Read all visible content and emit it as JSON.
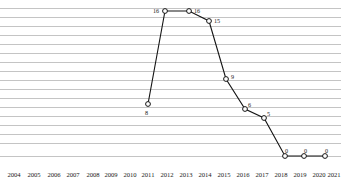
{
  "chart_data": {
    "type": "line",
    "title": "",
    "subtitle": "",
    "xlabel": "",
    "ylabel": "",
    "grid": true,
    "gridline_count": 17,
    "legend": null,
    "legend_position": "none",
    "xlim": [
      2004,
      2021
    ],
    "ylim": [
      0,
      17
    ],
    "marker": "open-circle",
    "line_color": "#141414",
    "marker_fill": "#ffffff",
    "gridline_color": "#c4c4c4",
    "categories": [
      "2004",
      "2005",
      "2006",
      "2007",
      "2008",
      "2009",
      "2010",
      "2011",
      "2012",
      "2013",
      "2014",
      "2015",
      "2016",
      "2017",
      "2018",
      "2019",
      "2020",
      "2021"
    ],
    "values": [
      null,
      null,
      null,
      null,
      null,
      null,
      null,
      null,
      8,
      16,
      16,
      15,
      9,
      6,
      5,
      0,
      0,
      0
    ],
    "point_labels": [
      {
        "x": "2012",
        "value": 8,
        "text": "8",
        "px": 148,
        "py": 104,
        "lx": 145,
        "ly": 110
      },
      {
        "x": "2013",
        "value": 16,
        "text": "16",
        "px": 165,
        "py": 11,
        "lx": 153,
        "ly": 8
      },
      {
        "x": "2014",
        "value": 16,
        "text": "16",
        "px": 189,
        "py": 11,
        "lx": 194,
        "ly": 8
      },
      {
        "x": "2015",
        "value": 15,
        "text": "15",
        "px": 209,
        "py": 21,
        "lx": 214,
        "ly": 18
      },
      {
        "x": "2016",
        "value": 9,
        "text": "9",
        "px": 226,
        "py": 79,
        "lx": 231,
        "ly": 74
      },
      {
        "x": "2017",
        "value": 6,
        "text": "6",
        "px": 245,
        "py": 109,
        "lx": 248,
        "ly": 102
      },
      {
        "x": "2018",
        "value": 5,
        "text": "5",
        "px": 264,
        "py": 118,
        "lx": 267,
        "ly": 111
      },
      {
        "x": "2019",
        "value": 0,
        "text": "0",
        "px": 285,
        "py": 156,
        "lx": 285,
        "ly": 148
      },
      {
        "x": "2020",
        "value": 0,
        "text": "0",
        "px": 304,
        "py": 156,
        "lx": 304,
        "ly": 148
      },
      {
        "x": "2021",
        "value": 0,
        "text": "0",
        "px": 325,
        "py": 156,
        "lx": 325,
        "ly": 148
      }
    ],
    "x_tick_positions": [
      14,
      34,
      54,
      73,
      93,
      111,
      130,
      148,
      167,
      186,
      205,
      224,
      243,
      262,
      281,
      300,
      319,
      334
    ],
    "gridline_y": [
      8,
      17,
      26,
      35,
      44,
      53,
      62,
      71,
      80,
      89,
      98,
      107,
      116,
      125,
      134,
      143,
      156
    ]
  }
}
